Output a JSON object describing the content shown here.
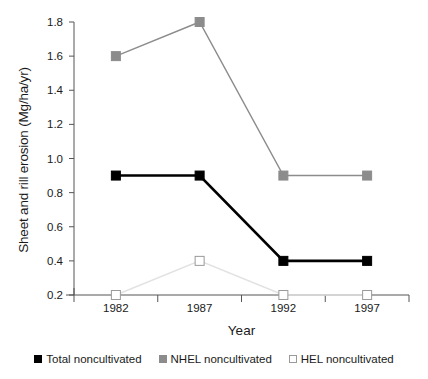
{
  "chart_data": {
    "type": "line",
    "title": "",
    "xlabel": "Year",
    "ylabel": "Sheet and rill erosion (Mg/ha/yr)",
    "categories": [
      "1982",
      "1987",
      "1992",
      "1997"
    ],
    "x": [
      1982,
      1987,
      1992,
      1997
    ],
    "ylim": [
      0.2,
      1.8
    ],
    "yticks": [
      "0.2",
      "0.4",
      "0.6",
      "0.8",
      "1.0",
      "1.2",
      "1.4",
      "1.6",
      "1.8"
    ],
    "ytick_values": [
      0.2,
      0.4,
      0.6,
      0.8,
      1.0,
      1.2,
      1.4,
      1.6,
      1.8
    ],
    "grid": false,
    "legend_position": "bottom",
    "series": [
      {
        "name": "Total noncultivated",
        "values": [
          0.9,
          0.9,
          0.4,
          0.4
        ],
        "color": "#000000",
        "marker": "filled-square",
        "marker_fill": "#000000"
      },
      {
        "name": "NHEL noncultivated",
        "values": [
          1.6,
          1.8,
          0.9,
          0.9
        ],
        "color": "#8c8c8c",
        "marker": "filled-square",
        "marker_fill": "#8c8c8c"
      },
      {
        "name": "HEL noncultivated",
        "values": [
          0.2,
          0.4,
          0.2,
          0.2
        ],
        "color": "#e2e2e2",
        "marker": "open-square",
        "marker_fill": "#ffffff"
      }
    ]
  },
  "legend": {
    "items": [
      {
        "label": "Total noncultivated",
        "swatch": "#000000",
        "border": "#000000"
      },
      {
        "label": "NHEL noncultivated",
        "swatch": "#8c8c8c",
        "border": "#8c8c8c"
      },
      {
        "label": "HEL noncultivated",
        "swatch": "#ffffff",
        "border": "#9a9a9a"
      }
    ]
  },
  "axes": {
    "axis_color": "#555555",
    "text_color": "#1a1a1a"
  }
}
